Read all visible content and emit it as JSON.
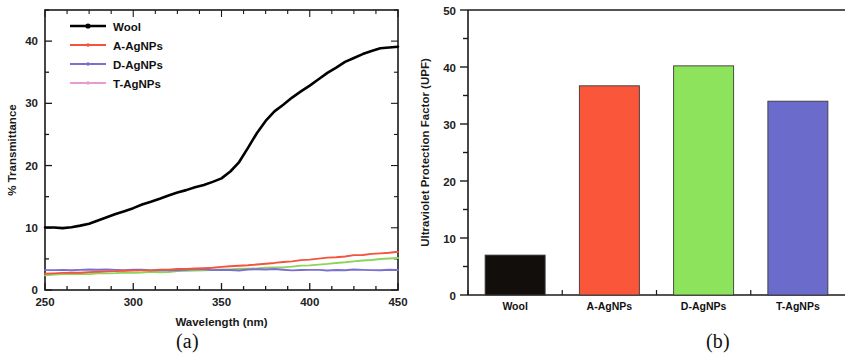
{
  "figure": {
    "panels": [
      {
        "id": "a",
        "caption": "(a)"
      },
      {
        "id": "b",
        "caption": "(b)"
      }
    ]
  },
  "chart_data": [
    {
      "type": "line",
      "panel": "(a)",
      "title": "",
      "xlabel": "Wavelength (nm)",
      "ylabel": "% Transmittance",
      "xlim": [
        250,
        450
      ],
      "ylim": [
        0,
        45
      ],
      "xticks": [
        250,
        300,
        350,
        400,
        450
      ],
      "yticks": [
        0,
        10,
        20,
        30,
        40
      ],
      "xminor_step": 12.5,
      "yminor_step": 5,
      "grid": false,
      "legend_position": "top-left",
      "x": [
        250,
        255,
        260,
        265,
        270,
        275,
        280,
        285,
        290,
        295,
        300,
        305,
        310,
        315,
        320,
        325,
        330,
        335,
        340,
        345,
        350,
        355,
        360,
        365,
        370,
        375,
        380,
        385,
        390,
        395,
        400,
        405,
        410,
        415,
        420,
        425,
        430,
        435,
        440,
        445,
        450
      ],
      "series": [
        {
          "name": "Wool",
          "color": "#000000",
          "marker": "line-dot",
          "values": [
            10.0,
            10.0,
            10.0,
            10.1,
            10.3,
            10.7,
            11.2,
            11.7,
            12.2,
            12.7,
            13.2,
            13.7,
            14.2,
            14.7,
            15.2,
            15.7,
            16.1,
            16.5,
            16.9,
            17.4,
            18.0,
            19.0,
            20.6,
            22.8,
            25.2,
            27.2,
            28.7,
            29.8,
            30.9,
            31.9,
            32.9,
            33.9,
            34.9,
            35.8,
            36.6,
            37.3,
            37.9,
            38.4,
            38.8,
            39.0,
            39.1
          ]
        },
        {
          "name": "A-AgNPs",
          "color": "#F2543C",
          "marker": "line-dot",
          "values": [
            2.6,
            2.65,
            2.7,
            2.75,
            2.8,
            2.85,
            2.9,
            2.95,
            3.0,
            3.05,
            3.1,
            3.15,
            3.2,
            3.25,
            3.3,
            3.35,
            3.4,
            3.45,
            3.5,
            3.6,
            3.7,
            3.8,
            3.9,
            4.0,
            4.1,
            4.2,
            4.35,
            4.5,
            4.6,
            4.75,
            4.9,
            5.0,
            5.15,
            5.3,
            5.4,
            5.55,
            5.65,
            5.8,
            5.9,
            6.0,
            6.1
          ]
        },
        {
          "name": "D-AgNPs",
          "color": "#7B6FD0",
          "marker": "line-dot",
          "values": [
            3.2,
            3.2,
            3.2,
            3.2,
            3.25,
            3.3,
            3.3,
            3.25,
            3.2,
            3.2,
            3.2,
            3.2,
            3.2,
            3.2,
            3.2,
            3.2,
            3.25,
            3.3,
            3.25,
            3.2,
            3.2,
            3.2,
            3.2,
            3.25,
            3.3,
            3.3,
            3.3,
            3.25,
            3.2,
            3.2,
            3.2,
            3.2,
            3.2,
            3.2,
            3.2,
            3.25,
            3.25,
            3.2,
            3.2,
            3.2,
            3.2
          ]
        },
        {
          "name": "T-AgNPs",
          "color": "#8CD45A",
          "marker": "line-dot",
          "values": [
            2.4,
            2.45,
            2.5,
            2.55,
            2.6,
            2.6,
            2.65,
            2.7,
            2.7,
            2.75,
            2.8,
            2.85,
            2.9,
            2.9,
            2.95,
            3.0,
            3.05,
            3.1,
            3.15,
            3.2,
            3.3,
            3.35,
            3.4,
            3.45,
            3.5,
            3.55,
            3.6,
            3.7,
            3.8,
            3.9,
            4.0,
            4.1,
            4.2,
            4.3,
            4.45,
            4.6,
            4.7,
            4.85,
            5.0,
            5.1,
            5.2
          ]
        }
      ],
      "legend": [
        {
          "label": "Wool",
          "color": "#000000"
        },
        {
          "label": "A-AgNPs",
          "color": "#F2543C"
        },
        {
          "label": "D-AgNPs",
          "color": "#7B6FD0"
        },
        {
          "label": "T-AgNPs",
          "color": "#E79BD2"
        }
      ]
    },
    {
      "type": "bar",
      "panel": "(b)",
      "title": "",
      "xlabel": "",
      "ylabel": "Ultraviolet Protection Factor (UPF)",
      "ylim": [
        0,
        50
      ],
      "yticks": [
        0,
        10,
        20,
        30,
        40,
        50
      ],
      "yminor_step": 5,
      "grid": false,
      "categories": [
        "Wool",
        "A-AgNPs",
        "D-AgNPs",
        "T-AgNPs"
      ],
      "values": [
        7.0,
        36.7,
        40.2,
        34.0
      ],
      "colors": [
        "#120E0C",
        "#F9563A",
        "#8DE35C",
        "#6B6BCC"
      ]
    }
  ]
}
